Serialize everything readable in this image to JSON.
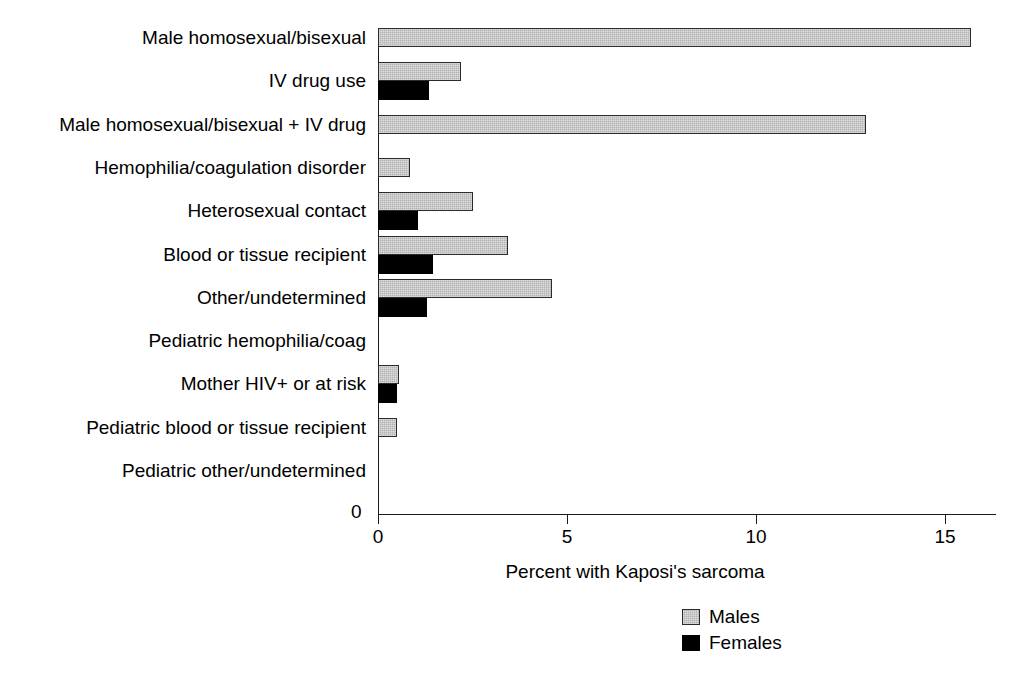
{
  "chart_data": {
    "type": "bar",
    "orientation": "horizontal",
    "title": "",
    "xlabel": "Percent with Kaposi's sarcoma",
    "ylabel": "",
    "xlim": [
      0,
      16.3
    ],
    "xticks": [
      0,
      5,
      10,
      15
    ],
    "xtick_labels": [
      "0",
      "5",
      "10",
      "15"
    ],
    "y_axis_origin_label": "0",
    "grid": false,
    "legend_position": "bottom-right",
    "categories": [
      "Male homosexual/bisexual",
      "IV drug use",
      "Male homosexual/bisexual + IV drug",
      "Hemophilia/coagulation disorder",
      "Heterosexual contact",
      "Blood or tissue recipient",
      "Other/undetermined",
      "Pediatric hemophilia/coag",
      "Mother HIV+ or at risk",
      "Pediatric blood or tissue recipient",
      "Pediatric other/undetermined"
    ],
    "series": [
      {
        "name": "Males",
        "color": "#b3b3b3",
        "values": [
          15.7,
          2.2,
          12.9,
          0.85,
          2.5,
          3.45,
          4.6,
          0,
          0.55,
          0.5,
          0
        ]
      },
      {
        "name": "Females",
        "color": "#000000",
        "values": [
          0,
          1.35,
          0,
          0,
          1.05,
          1.45,
          1.3,
          0,
          0.5,
          0,
          0
        ]
      }
    ]
  },
  "legend": {
    "entries": [
      {
        "label": "Males"
      },
      {
        "label": "Females"
      }
    ]
  }
}
